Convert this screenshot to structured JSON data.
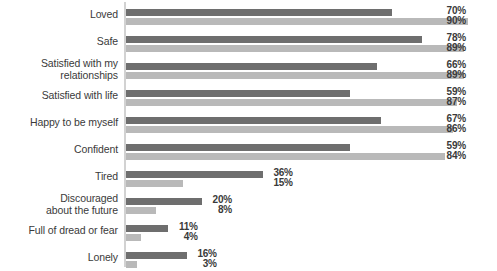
{
  "chart_data": {
    "type": "bar",
    "orientation": "horizontal",
    "title": "",
    "subtitle": "",
    "xlabel": "",
    "ylabel": "",
    "xlim": [
      0,
      100
    ],
    "grid": false,
    "legend": null,
    "value_suffix": "%",
    "categories": [
      "Loved",
      "Safe",
      "Satisfied with my\nrelationships",
      "Satisfied with life",
      "Happy to be myself",
      "Confident",
      "Tired",
      "Discouraged\nabout the future",
      "Full of dread or fear",
      "Lonely"
    ],
    "series": [
      {
        "name": "series-1",
        "color": "#6e6e6e",
        "values": [
          70,
          78,
          66,
          59,
          67,
          59,
          36,
          20,
          11,
          16
        ]
      },
      {
        "name": "series-2",
        "color": "#b9b9b9",
        "values": [
          90,
          89,
          89,
          87,
          86,
          84,
          15,
          8,
          4,
          3
        ]
      }
    ],
    "value_labels": [
      {
        "v1": "70%",
        "v2": "90%"
      },
      {
        "v1": "78%",
        "v2": "89%"
      },
      {
        "v1": "66%",
        "v2": "89%"
      },
      {
        "v1": "59%",
        "v2": "87%"
      },
      {
        "v1": "67%",
        "v2": "86%"
      },
      {
        "v1": "59%",
        "v2": "84%"
      },
      {
        "v1": "36%",
        "v2": "15%"
      },
      {
        "v1": "20%",
        "v2": "8%"
      },
      {
        "v1": "11%",
        "v2": "4%"
      },
      {
        "v1": "16%",
        "v2": "3%"
      }
    ],
    "rows": [
      {
        "label_line1": "Loved",
        "label_line2": "",
        "v1": 70,
        "v2": 90,
        "v1_text": "70%",
        "v2_text": "90%"
      },
      {
        "label_line1": "Safe",
        "label_line2": "",
        "v1": 78,
        "v2": 89,
        "v1_text": "78%",
        "v2_text": "89%"
      },
      {
        "label_line1": "Satisfied with my",
        "label_line2": "relationships",
        "v1": 66,
        "v2": 89,
        "v1_text": "66%",
        "v2_text": "89%"
      },
      {
        "label_line1": "Satisfied with life",
        "label_line2": "",
        "v1": 59,
        "v2": 87,
        "v1_text": "59%",
        "v2_text": "87%"
      },
      {
        "label_line1": "Happy to be myself",
        "label_line2": "",
        "v1": 67,
        "v2": 86,
        "v1_text": "67%",
        "v2_text": "86%"
      },
      {
        "label_line1": "Confident",
        "label_line2": "",
        "v1": 59,
        "v2": 84,
        "v1_text": "59%",
        "v2_text": "84%"
      },
      {
        "label_line1": "Tired",
        "label_line2": "",
        "v1": 36,
        "v2": 15,
        "v1_text": "36%",
        "v2_text": "15%"
      },
      {
        "label_line1": "Discouraged",
        "label_line2": "about the future",
        "v1": 20,
        "v2": 8,
        "v1_text": "20%",
        "v2_text": "8%"
      },
      {
        "label_line1": "Full of dread or fear",
        "label_line2": "",
        "v1": 11,
        "v2": 4,
        "v1_text": "11%",
        "v2_text": "4%"
      },
      {
        "label_line1": "Lonely",
        "label_line2": "",
        "v1": 16,
        "v2": 3,
        "v1_text": "16%",
        "v2_text": "3%"
      }
    ]
  },
  "layout": {
    "row_height": 27,
    "row_top_offset": 3,
    "px_per_percent": 3.8,
    "bar_origin_x": 126,
    "label_group_right_x": 466,
    "series1_color": "#6e6e6e",
    "series2_color": "#b9b9b9",
    "axis_color": "#d2d2d2",
    "text_color": "#3a3a3a"
  }
}
